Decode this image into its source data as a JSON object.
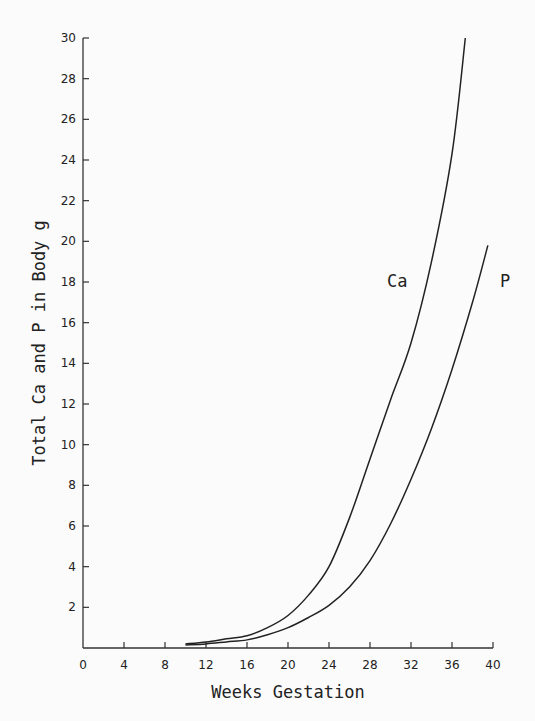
{
  "chart_data": {
    "type": "line",
    "title": "",
    "xlabel": "Weeks Gestation",
    "ylabel": "Total Ca and P in Body g",
    "xlim": [
      0,
      40
    ],
    "ylim": [
      0,
      30
    ],
    "x_ticks": [
      "0",
      "4",
      "8",
      "12",
      "16",
      "20",
      "24",
      "28",
      "32",
      "36",
      "40"
    ],
    "y_ticks": [
      "2",
      "4",
      "6",
      "8",
      "10",
      "12",
      "14",
      "16",
      "18",
      "20",
      "22",
      "24",
      "26",
      "28",
      "30"
    ],
    "grid": false,
    "legend": "inline labels",
    "series": [
      {
        "name": "Ca",
        "x": [
          10,
          12,
          14,
          16,
          18,
          20,
          22,
          24,
          26,
          28,
          30,
          32,
          34,
          36,
          37.3
        ],
        "values": [
          0.2,
          0.3,
          0.45,
          0.6,
          1.0,
          1.6,
          2.6,
          4.0,
          6.4,
          9.3,
          12.2,
          15.0,
          19.0,
          24.3,
          30.0
        ]
      },
      {
        "name": "P",
        "x": [
          10,
          12,
          14,
          16,
          18,
          20,
          22,
          24,
          26,
          28,
          30,
          32,
          34,
          36,
          38,
          39.5
        ],
        "values": [
          0.15,
          0.2,
          0.3,
          0.4,
          0.65,
          1.0,
          1.5,
          2.1,
          3.0,
          4.3,
          6.1,
          8.3,
          10.8,
          13.7,
          17.0,
          19.8
        ]
      }
    ]
  }
}
